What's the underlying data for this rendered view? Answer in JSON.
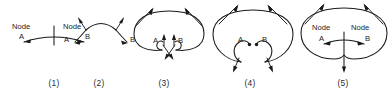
{
  "figure": {
    "type": "diagram",
    "background_color": "#ffffff",
    "stroke_color": "#1a1a1a",
    "panels": [
      {
        "id": "panel-1",
        "caption": "(1)",
        "caption_x": 54,
        "node_a_label": "Node",
        "node_a_sub": "A",
        "node_b_label": "Node",
        "node_b_sub": "B",
        "has_boundary": false,
        "center_tick": true
      },
      {
        "id": "panel-2",
        "caption": "(2)",
        "caption_x": 99,
        "node_a_label": "",
        "node_a_sub": "A",
        "node_b_label": "",
        "node_b_sub": "B",
        "has_boundary": false,
        "center_tick": false
      },
      {
        "id": "panel-3",
        "caption": "(3)",
        "caption_x": 164,
        "node_a_label": "",
        "node_a_sub": "A",
        "node_b_label": "",
        "node_b_sub": "B",
        "has_boundary": true,
        "center_tick": false
      },
      {
        "id": "panel-4",
        "caption": "(4)",
        "caption_x": 250,
        "node_a_label": "",
        "node_a_sub": "A",
        "node_b_label": "",
        "node_b_sub": "B",
        "has_boundary": true,
        "center_tick": false
      },
      {
        "id": "panel-5",
        "caption": "(5)",
        "caption_x": 343,
        "node_a_label": "Node",
        "node_a_sub": "A",
        "node_b_label": "Node",
        "node_b_sub": "B",
        "has_boundary": true,
        "center_tick": true
      }
    ]
  }
}
